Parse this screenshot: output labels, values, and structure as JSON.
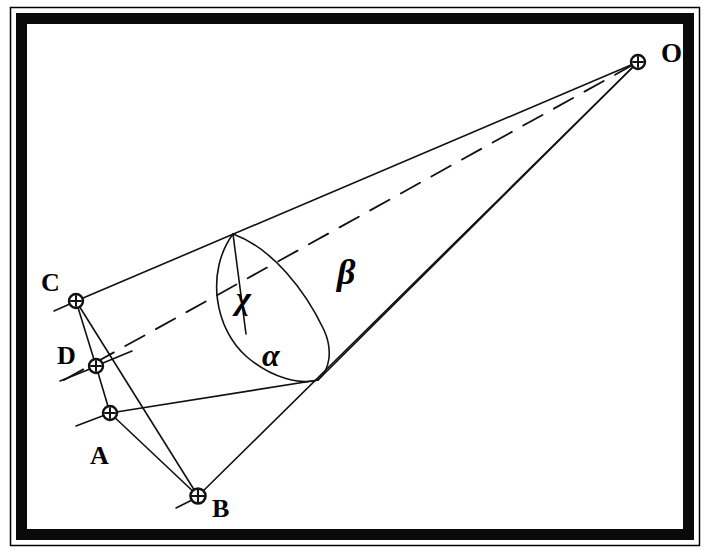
{
  "figure": {
    "background_color": "#ffffff",
    "ink_color": "#000000",
    "frame": {
      "outer_rect": {
        "x": 10,
        "y": 7,
        "width": 690,
        "height": 539
      },
      "thick_border_rect": {
        "x": 16,
        "y": 13,
        "width": 678,
        "height": 527
      },
      "border_thickness": 11,
      "inner_rect": {
        "x": 27,
        "y": 24,
        "width": 656,
        "height": 505
      }
    },
    "points": [
      {
        "id": "O",
        "label": "O",
        "x": 638,
        "y": 62,
        "label_x": 661,
        "label_y": 58,
        "marker": "circled-cross"
      },
      {
        "id": "C",
        "label": "C",
        "x": 76,
        "y": 301,
        "label_x": 46,
        "label_y": 285,
        "marker": "circled-cross"
      },
      {
        "id": "D",
        "label": "D",
        "x": 96,
        "y": 366,
        "label_x": 64,
        "label_y": 357,
        "marker": "circled-cross"
      },
      {
        "id": "A",
        "label": "A",
        "x": 110,
        "y": 413,
        "label_x": 98,
        "label_y": 461,
        "marker": "circled-cross"
      },
      {
        "id": "B",
        "label": "B",
        "x": 198,
        "y": 496,
        "label_x": 220,
        "label_y": 511,
        "marker": "circled-cross"
      }
    ],
    "greek_labels": [
      {
        "id": "chi",
        "glyph": "χ",
        "x": 247,
        "y": 298,
        "size": 30
      },
      {
        "id": "alpha",
        "glyph": "α",
        "x": 272,
        "y": 355,
        "size": 30
      },
      {
        "id": "beta",
        "glyph": "β",
        "x": 345,
        "y": 272,
        "size": 34
      }
    ],
    "solid_lines": [
      {
        "name": "edge-C-to-O",
        "x1": 76,
        "y1": 301,
        "x2": 638,
        "y2": 62
      },
      {
        "name": "edge-B-to-O",
        "x1": 198,
        "y1": 496,
        "x2": 638,
        "y2": 62
      },
      {
        "name": "edge-A-to-O",
        "x1": 110,
        "y1": 413,
        "x2": 638,
        "y2": 62
      },
      {
        "name": "segment-C-to-A",
        "x1": 76,
        "y1": 301,
        "x2": 110,
        "y2": 413
      },
      {
        "name": "segment-C-to-B",
        "x1": 76,
        "y1": 301,
        "x2": 198,
        "y2": 496
      },
      {
        "name": "segment-A-to-B",
        "x1": 110,
        "y1": 413,
        "x2": 198,
        "y2": 496
      },
      {
        "name": "ellipse-chord",
        "x1": 233,
        "y1": 234,
        "x2": 246,
        "y2": 334
      }
    ],
    "dashed_lines": [
      {
        "name": "axis-D-to-O",
        "x1": 67,
        "y1": 377,
        "x2": 638,
        "y2": 62
      }
    ],
    "tick_marks": [
      {
        "name": "tick-at-C",
        "x1": 55,
        "y1": 311,
        "x2": 73,
        "y2": 303
      },
      {
        "name": "tick-at-D-left",
        "x1": 62,
        "y1": 379,
        "x2": 92,
        "y2": 368
      },
      {
        "name": "tick-at-D-right",
        "x1": 100,
        "y1": 364,
        "x2": 130,
        "y2": 353
      },
      {
        "name": "tick-at-A-left",
        "x1": 78,
        "y1": 425,
        "x2": 106,
        "y2": 415
      },
      {
        "name": "tick-at-B",
        "x1": 178,
        "y1": 507,
        "x2": 195,
        "y2": 498
      }
    ],
    "ellipse_arc": {
      "name": "cross-section-ellipse",
      "top_x": 233,
      "top_y": 234,
      "bottom_x": 318,
      "bottom_y": 380,
      "left_bulge": 228,
      "right_bulge": 340
    },
    "cone_base_curve": {
      "name": "base-arc-A-to-B",
      "from_x": 110,
      "from_y": 413,
      "to_x": 198,
      "to_y": 496
    }
  }
}
